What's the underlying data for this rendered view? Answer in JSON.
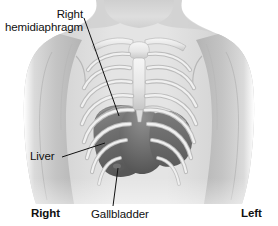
{
  "figure": {
    "kind": "anatomical-illustration",
    "style": "grayscale medical illustration"
  },
  "labels": {
    "hemidiaphragm_line1": "Right",
    "hemidiaphragm_line2": "hemidiaphragm",
    "liver": "Liver",
    "gallbladder": "Gallbladder",
    "side_right": "Right",
    "side_left": "Left"
  },
  "colors": {
    "background": "#ffffff",
    "skin_light": "#e2e2e2",
    "skin_mid": "#c8c8c8",
    "skin_shadow": "#a8a8a8",
    "bone_light": "#f2f2f2",
    "bone_mid": "#dcdcdc",
    "bone_edge": "#9a9a9a",
    "organ_dark": "#5e5e5e",
    "organ_mid": "#787878",
    "organ_light": "#8e8e8e",
    "leader_line": "#111111",
    "text": "#101010"
  },
  "leaders": [
    {
      "name": "hemidiaphragm-leader",
      "from_x": 84,
      "from_y": 18,
      "to_x": 119,
      "to_y": 116
    },
    {
      "name": "liver-leader",
      "from_x": 62,
      "from_y": 157,
      "to_x": 105,
      "to_y": 143
    },
    {
      "name": "gallbladder-leader",
      "from_x": 113,
      "from_y": 206,
      "to_x": 118,
      "to_y": 168
    }
  ]
}
